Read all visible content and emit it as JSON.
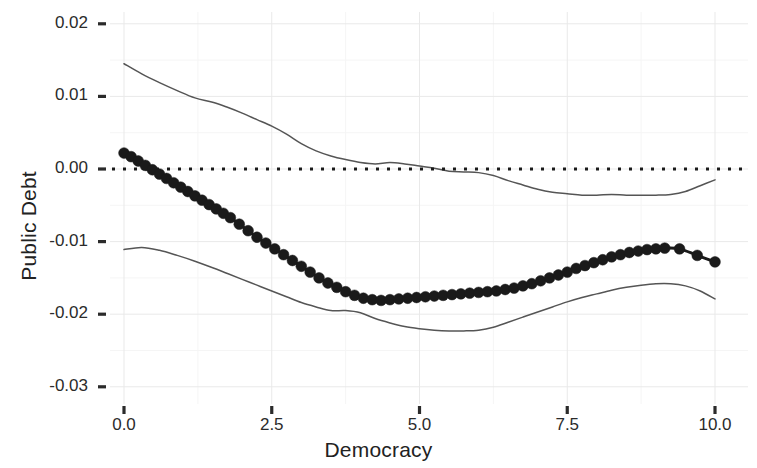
{
  "chart_data": {
    "type": "line",
    "title": "",
    "xlabel": "Democracy",
    "ylabel": "Public Debt",
    "xlim": [
      -0.25,
      10.25
    ],
    "ylim": [
      -0.0335,
      0.0235
    ],
    "xticks": [
      0.0,
      2.5,
      5.0,
      7.5,
      10.0
    ],
    "xtick_labels": [
      "0.0",
      "2.5",
      "5.0",
      "7.5",
      "10.0"
    ],
    "yticks": [
      0.02,
      0.01,
      0.0,
      -0.01,
      -0.02,
      -0.03
    ],
    "ytick_labels": [
      "0.02",
      "0.01",
      "0.00",
      "-0.01",
      "-0.02",
      "-0.03"
    ],
    "grid": true,
    "grid_minor": true,
    "legend": "none",
    "series": [
      {
        "name": "Marginal effect (point estimate)",
        "style": "line-with-markers",
        "marker": "filled-circle",
        "color": "#1a1a1a",
        "x": [
          0.0,
          0.12,
          0.24,
          0.36,
          0.48,
          0.6,
          0.72,
          0.84,
          0.96,
          1.08,
          1.2,
          1.32,
          1.44,
          1.56,
          1.68,
          1.8,
          1.95,
          2.1,
          2.25,
          2.4,
          2.55,
          2.7,
          2.85,
          3.0,
          3.15,
          3.3,
          3.45,
          3.6,
          3.75,
          3.9,
          4.05,
          4.2,
          4.35,
          4.5,
          4.65,
          4.8,
          4.95,
          5.1,
          5.25,
          5.4,
          5.55,
          5.7,
          5.85,
          6.0,
          6.15,
          6.3,
          6.45,
          6.6,
          6.75,
          6.9,
          7.05,
          7.2,
          7.35,
          7.5,
          7.65,
          7.8,
          7.95,
          8.1,
          8.25,
          8.4,
          8.55,
          8.7,
          8.85,
          9.0,
          9.15,
          9.4,
          9.7,
          10.0
        ],
        "y": [
          0.0022,
          0.0017,
          0.0011,
          0.0005,
          -0.0001,
          -0.0007,
          -0.0013,
          -0.0019,
          -0.0025,
          -0.0031,
          -0.0037,
          -0.0043,
          -0.0049,
          -0.0055,
          -0.0061,
          -0.0067,
          -0.0076,
          -0.0085,
          -0.0094,
          -0.0102,
          -0.011,
          -0.0118,
          -0.0126,
          -0.0134,
          -0.0142,
          -0.015,
          -0.0157,
          -0.0163,
          -0.0169,
          -0.0174,
          -0.0178,
          -0.018,
          -0.0181,
          -0.018,
          -0.0179,
          -0.0178,
          -0.0177,
          -0.0176,
          -0.0175,
          -0.0174,
          -0.0173,
          -0.0172,
          -0.0171,
          -0.017,
          -0.0169,
          -0.0168,
          -0.0166,
          -0.0164,
          -0.0161,
          -0.0158,
          -0.0154,
          -0.015,
          -0.0146,
          -0.0142,
          -0.0137,
          -0.0133,
          -0.0129,
          -0.0125,
          -0.0121,
          -0.0118,
          -0.0115,
          -0.0113,
          -0.0111,
          -0.011,
          -0.0109,
          -0.011,
          -0.0119,
          -0.0128
        ]
      },
      {
        "name": "Upper 95% confidence bound",
        "style": "thin-line",
        "color": "#555555",
        "x": [
          0.0,
          0.3,
          0.6,
          0.9,
          1.2,
          1.5,
          1.75,
          2.0,
          2.25,
          2.5,
          2.75,
          3.0,
          3.25,
          3.5,
          3.75,
          4.0,
          4.25,
          4.5,
          4.75,
          5.0,
          5.25,
          5.5,
          5.75,
          6.0,
          6.25,
          6.5,
          6.75,
          7.0,
          7.25,
          7.5,
          7.75,
          8.0,
          8.25,
          8.5,
          8.75,
          9.0,
          9.25,
          9.5,
          9.75,
          10.0
        ],
        "y": [
          0.0145,
          0.0131,
          0.0119,
          0.0108,
          0.0098,
          0.0092,
          0.0085,
          0.0077,
          0.0068,
          0.0059,
          0.0048,
          0.0035,
          0.0025,
          0.0018,
          0.0013,
          0.0009,
          0.0007,
          0.0009,
          0.0007,
          0.0004,
          0.0001,
          -0.0003,
          -0.0004,
          -0.0005,
          -0.0009,
          -0.0016,
          -0.0022,
          -0.0028,
          -0.0032,
          -0.0034,
          -0.0036,
          -0.0036,
          -0.0035,
          -0.0036,
          -0.0036,
          -0.0036,
          -0.0035,
          -0.0031,
          -0.0023,
          -0.0015
        ]
      },
      {
        "name": "Lower 95% confidence bound",
        "style": "thin-line",
        "color": "#555555",
        "x": [
          0.0,
          0.3,
          0.6,
          0.9,
          1.2,
          1.5,
          1.75,
          2.0,
          2.25,
          2.5,
          2.75,
          3.0,
          3.25,
          3.5,
          3.75,
          4.0,
          4.25,
          4.5,
          4.75,
          5.0,
          5.25,
          5.5,
          5.75,
          6.0,
          6.25,
          6.5,
          6.75,
          7.0,
          7.25,
          7.5,
          7.75,
          8.0,
          8.25,
          8.5,
          8.75,
          9.0,
          9.25,
          9.5,
          9.75,
          10.0
        ],
        "y": [
          -0.0111,
          -0.0108,
          -0.0112,
          -0.0119,
          -0.0127,
          -0.0136,
          -0.0144,
          -0.0152,
          -0.016,
          -0.0168,
          -0.0176,
          -0.0184,
          -0.019,
          -0.0195,
          -0.0195,
          -0.0198,
          -0.0206,
          -0.0212,
          -0.0217,
          -0.022,
          -0.0222,
          -0.0223,
          -0.0223,
          -0.0222,
          -0.0218,
          -0.0211,
          -0.0204,
          -0.0197,
          -0.019,
          -0.0183,
          -0.0177,
          -0.0172,
          -0.0167,
          -0.0163,
          -0.016,
          -0.0158,
          -0.0158,
          -0.0161,
          -0.0168,
          -0.0179
        ]
      },
      {
        "name": "Zero reference line",
        "style": "dotted-line",
        "color": "#1a1a1a",
        "y_constant": 0.0
      }
    ]
  },
  "axes": {
    "x_title": "Democracy",
    "y_title": "Public Debt"
  }
}
